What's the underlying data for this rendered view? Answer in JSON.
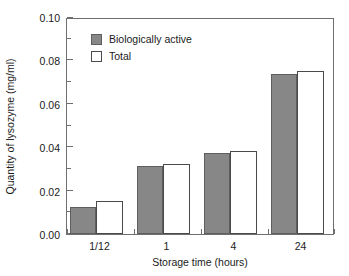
{
  "chart_data": {
    "type": "bar",
    "title": "",
    "xlabel": "Storage time (hours)",
    "ylabel": "Quantity of lysozyme (mg/ml)",
    "categories": [
      "1/12",
      "1",
      "4",
      "24"
    ],
    "series": [
      {
        "name": "Biologically active",
        "color": "#878787",
        "values": [
          0.0125,
          0.0315,
          0.0375,
          0.0745
        ]
      },
      {
        "name": "Total",
        "color": "#ffffff",
        "values": [
          0.0155,
          0.0325,
          0.0385,
          0.076
        ]
      }
    ],
    "ylim": [
      0.0,
      0.1
    ],
    "ytick_labels": [
      "0.00",
      "0.02",
      "0.04",
      "0.06",
      "0.08",
      "0.10"
    ],
    "ytick_values": [
      0.0,
      0.02,
      0.04,
      0.06,
      0.08,
      0.1
    ],
    "yminor_values": [
      0.01,
      0.03,
      0.05,
      0.07,
      0.09
    ],
    "grid": false,
    "legend_position": "upper left",
    "legend_entries": [
      "Biologically active",
      "Total"
    ]
  }
}
